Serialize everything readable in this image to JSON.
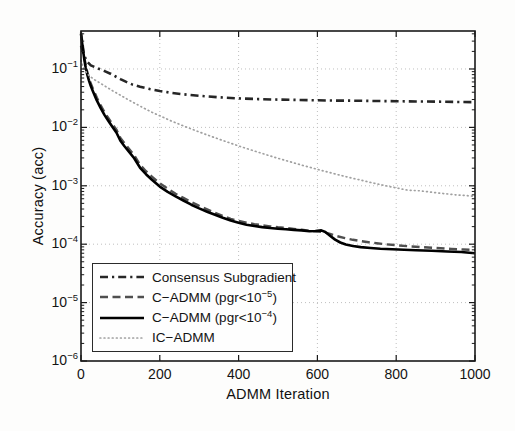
{
  "window": {
    "width": 515,
    "height": 431,
    "background": "#fdfdfc"
  },
  "axes": {
    "xlabel": "ADMM Iteration",
    "ylabel": "Accuracy (acc)",
    "x_tick_labels": [
      "0",
      "200",
      "400",
      "600",
      "800",
      "1000"
    ],
    "y_tick_base": "10",
    "y_tick_exponents": [
      "−1",
      "−2",
      "−3",
      "−4",
      "−5",
      "−6"
    ]
  },
  "style": {
    "frame_color": "#1a1a1a",
    "grid_color": "#bfbfbf",
    "tick_label_color": "#141414",
    "plot_bg": "#ffffff"
  },
  "legend": {
    "position": "lower-left",
    "entries": [
      {
        "series_id": "consensus-subgradient",
        "label_pre": "Consensus Subgradient",
        "label_sup": "",
        "label_post": ""
      },
      {
        "series_id": "c-admm-pgr-1e-5",
        "label_pre": "C−ADMM (pgr<10",
        "label_sup": "−5",
        "label_post": ")"
      },
      {
        "series_id": "c-admm-pgr-1e-4",
        "label_pre": "C−ADMM (pgr<10",
        "label_sup": "−4",
        "label_post": ")"
      },
      {
        "series_id": "ic-admm",
        "label_pre": "IC−ADMM",
        "label_sup": "",
        "label_post": ""
      }
    ]
  },
  "chart_data": {
    "type": "line",
    "title": "",
    "xlabel": "ADMM Iteration",
    "ylabel": "Accuracy (acc)",
    "x_scale": "linear",
    "y_scale": "log",
    "xlim": [
      0,
      1000
    ],
    "ylim": [
      1e-06,
      0.447
    ],
    "x_ticks": [
      0,
      200,
      400,
      600,
      800,
      1000
    ],
    "y_ticks": [
      0.1,
      0.01,
      0.001,
      0.0001,
      1e-05,
      1e-06
    ],
    "grid": true,
    "legend_position": "lower-left",
    "series": [
      {
        "id": "consensus-subgradient",
        "name": "Consensus Subgradient",
        "line_style": "dash-dot",
        "color": "#262626",
        "line_width": 2.6,
        "points": [
          [
            0,
            0.25
          ],
          [
            8,
            0.17
          ],
          [
            15,
            0.135
          ],
          [
            25,
            0.115
          ],
          [
            40,
            0.104
          ],
          [
            50,
            0.098
          ],
          [
            60,
            0.092
          ],
          [
            75,
            0.083
          ],
          [
            90,
            0.073
          ],
          [
            100,
            0.067
          ],
          [
            115,
            0.06
          ],
          [
            130,
            0.0545
          ],
          [
            150,
            0.0495
          ],
          [
            175,
            0.0452
          ],
          [
            200,
            0.042
          ],
          [
            230,
            0.039
          ],
          [
            260,
            0.0368
          ],
          [
            300,
            0.0347
          ],
          [
            350,
            0.0327
          ],
          [
            400,
            0.0314
          ],
          [
            450,
            0.0305
          ],
          [
            500,
            0.0299
          ],
          [
            550,
            0.0295
          ],
          [
            600,
            0.0291
          ],
          [
            650,
            0.0288
          ],
          [
            700,
            0.0286
          ],
          [
            750,
            0.0283
          ],
          [
            800,
            0.0281
          ],
          [
            850,
            0.0278
          ],
          [
            900,
            0.0276
          ],
          [
            950,
            0.0273
          ],
          [
            1000,
            0.027
          ]
        ]
      },
      {
        "id": "c-admm-pgr-1e-5",
        "name": "C-ADMM (pgr<1e-5)",
        "line_style": "dashed",
        "color": "#4f4f4f",
        "line_width": 2.4,
        "points": [
          [
            0,
            0.42
          ],
          [
            4,
            0.27
          ],
          [
            8,
            0.165
          ],
          [
            12,
            0.115
          ],
          [
            16,
            0.088
          ],
          [
            20,
            0.071
          ],
          [
            25,
            0.0565
          ],
          [
            30,
            0.0465
          ],
          [
            40,
            0.0325
          ],
          [
            50,
            0.0238
          ],
          [
            60,
            0.0181
          ],
          [
            70,
            0.0142
          ],
          [
            80,
            0.0113
          ],
          [
            90,
            0.0091
          ],
          [
            100,
            0.0066
          ],
          [
            110,
            0.0054
          ],
          [
            120,
            0.00445
          ],
          [
            135,
            0.00335
          ],
          [
            150,
            0.00228
          ],
          [
            165,
            0.00178
          ],
          [
            180,
            0.00143
          ],
          [
            200,
            0.0011
          ],
          [
            220,
            0.00089
          ],
          [
            240,
            0.00073
          ],
          [
            260,
            0.00062
          ],
          [
            280,
            0.00053
          ],
          [
            300,
            0.000455
          ],
          [
            320,
            0.000395
          ],
          [
            340,
            0.000345
          ],
          [
            360,
            0.000305
          ],
          [
            380,
            0.000272
          ],
          [
            400,
            0.00025
          ],
          [
            420,
            0.000234
          ],
          [
            440,
            0.000221
          ],
          [
            460,
            0.000211
          ],
          [
            480,
            0.000202
          ],
          [
            500,
            0.000195
          ],
          [
            520,
            0.000189
          ],
          [
            540,
            0.000183
          ],
          [
            560,
            0.000177
          ],
          [
            580,
            0.00017
          ],
          [
            600,
            0.000164
          ],
          [
            615,
            0.000161
          ],
          [
            630,
            0.000151
          ],
          [
            650,
            0.000137
          ],
          [
            670,
            0.000127
          ],
          [
            690,
            0.000119
          ],
          [
            710,
            0.000113
          ],
          [
            730,
            0.000108
          ],
          [
            750,
            0.000104
          ],
          [
            775,
            9.95e-05
          ],
          [
            800,
            9.6e-05
          ],
          [
            830,
            9.25e-05
          ],
          [
            860,
            8.95e-05
          ],
          [
            900,
            8.6e-05
          ],
          [
            940,
            8.3e-05
          ],
          [
            970,
            8.12e-05
          ],
          [
            1000,
            8e-05
          ]
        ]
      },
      {
        "id": "c-admm-pgr-1e-4",
        "name": "C-ADMM (pgr<1e-4)",
        "line_style": "solid",
        "color": "#000000",
        "line_width": 2.6,
        "points": [
          [
            0,
            0.4
          ],
          [
            4,
            0.24
          ],
          [
            8,
            0.15
          ],
          [
            12,
            0.105
          ],
          [
            16,
            0.08
          ],
          [
            20,
            0.064
          ],
          [
            25,
            0.051
          ],
          [
            30,
            0.042
          ],
          [
            40,
            0.029
          ],
          [
            50,
            0.0213
          ],
          [
            60,
            0.0162
          ],
          [
            70,
            0.0127
          ],
          [
            80,
            0.0101
          ],
          [
            90,
            0.0081
          ],
          [
            100,
            0.0059
          ],
          [
            110,
            0.0048
          ],
          [
            120,
            0.00395
          ],
          [
            135,
            0.00295
          ],
          [
            150,
            0.00203
          ],
          [
            165,
            0.00158
          ],
          [
            180,
            0.00127
          ],
          [
            200,
            0.00097
          ],
          [
            220,
            0.00079
          ],
          [
            240,
            0.00066
          ],
          [
            260,
            0.00056
          ],
          [
            280,
            0.000475
          ],
          [
            300,
            0.00041
          ],
          [
            320,
            0.00036
          ],
          [
            340,
            0.000318
          ],
          [
            360,
            0.000284
          ],
          [
            380,
            0.000255
          ],
          [
            400,
            0.000232
          ],
          [
            420,
            0.000216
          ],
          [
            440,
            0.000205
          ],
          [
            460,
            0.000196
          ],
          [
            480,
            0.000189
          ],
          [
            500,
            0.000184
          ],
          [
            520,
            0.00018
          ],
          [
            540,
            0.000176
          ],
          [
            560,
            0.000172
          ],
          [
            580,
            0.000167
          ],
          [
            595,
            0.000168
          ],
          [
            610,
            0.000172
          ],
          [
            620,
            0.000162
          ],
          [
            632,
            0.00014
          ],
          [
            645,
            0.00012
          ],
          [
            658,
            0.000107
          ],
          [
            672,
            9.9e-05
          ],
          [
            690,
            9.3e-05
          ],
          [
            710,
            8.9e-05
          ],
          [
            735,
            8.6e-05
          ],
          [
            760,
            8.38e-05
          ],
          [
            790,
            8.2e-05
          ],
          [
            820,
            8.05e-05
          ],
          [
            850,
            7.9e-05
          ],
          [
            890,
            7.7e-05
          ],
          [
            930,
            7.5e-05
          ],
          [
            965,
            7.35e-05
          ],
          [
            1000,
            7e-05
          ]
        ]
      },
      {
        "id": "ic-admm",
        "name": "IC-ADMM",
        "line_style": "dotted",
        "color": "#a0a0a0",
        "line_width": 1.7,
        "points": [
          [
            0,
            0.14
          ],
          [
            8,
            0.098
          ],
          [
            20,
            0.077
          ],
          [
            35,
            0.065
          ],
          [
            50,
            0.0565
          ],
          [
            65,
            0.049
          ],
          [
            80,
            0.0425
          ],
          [
            100,
            0.0355
          ],
          [
            120,
            0.0297
          ],
          [
            140,
            0.0251
          ],
          [
            160,
            0.0213
          ],
          [
            180,
            0.0182
          ],
          [
            200,
            0.0158
          ],
          [
            230,
            0.0128
          ],
          [
            260,
            0.0106
          ],
          [
            290,
            0.00885
          ],
          [
            320,
            0.00745
          ],
          [
            350,
            0.0063
          ],
          [
            380,
            0.00535
          ],
          [
            410,
            0.00458
          ],
          [
            440,
            0.00394
          ],
          [
            470,
            0.00341
          ],
          [
            500,
            0.00296
          ],
          [
            530,
            0.00258
          ],
          [
            560,
            0.00226
          ],
          [
            590,
            0.00199
          ],
          [
            620,
            0.00176
          ],
          [
            650,
            0.00156
          ],
          [
            680,
            0.00139
          ],
          [
            710,
            0.00125
          ],
          [
            740,
            0.00112
          ],
          [
            770,
            0.00101
          ],
          [
            800,
            0.00092
          ],
          [
            830,
            0.00084
          ],
          [
            860,
            0.00082
          ],
          [
            900,
            0.00076
          ],
          [
            950,
            0.0007
          ],
          [
            1000,
            0.00066
          ]
        ]
      }
    ]
  }
}
